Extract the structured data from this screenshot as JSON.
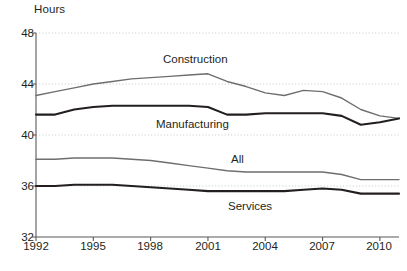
{
  "chart_data": {
    "type": "line",
    "title": "",
    "xlabel": "",
    "ylabel": "Hours",
    "ylim": [
      32,
      48
    ],
    "xlim": [
      1992,
      2011
    ],
    "yticks": [
      48,
      44,
      40,
      36,
      32
    ],
    "xticks": [
      1992,
      1995,
      1998,
      2001,
      2004,
      2007,
      2010
    ],
    "grid": "horizontal-dotted",
    "legend": "inline-annotations",
    "x": [
      1992,
      1993,
      1994,
      1995,
      1996,
      1997,
      1998,
      1999,
      2000,
      2001,
      2002,
      2003,
      2004,
      2005,
      2006,
      2007,
      2008,
      2009,
      2010,
      2011
    ],
    "series": [
      {
        "name": "Construction",
        "color": "#6d6e71",
        "width": 1.4,
        "values": [
          43.1,
          43.4,
          43.7,
          44.0,
          44.2,
          44.4,
          44.5,
          44.6,
          44.7,
          44.8,
          44.2,
          43.8,
          43.3,
          43.1,
          43.5,
          43.4,
          42.9,
          42.0,
          41.5,
          41.3
        ]
      },
      {
        "name": "Manufacturing",
        "color": "#231f20",
        "width": 2.1,
        "values": [
          41.6,
          41.6,
          42.0,
          42.2,
          42.3,
          42.3,
          42.3,
          42.3,
          42.3,
          42.2,
          41.6,
          41.6,
          41.7,
          41.7,
          41.7,
          41.7,
          41.5,
          40.8,
          41.0,
          41.3
        ]
      },
      {
        "name": "All",
        "color": "#6d6e71",
        "width": 1.4,
        "values": [
          38.1,
          38.1,
          38.2,
          38.2,
          38.2,
          38.1,
          38.0,
          37.8,
          37.6,
          37.4,
          37.2,
          37.1,
          37.1,
          37.1,
          37.1,
          37.1,
          36.9,
          36.5,
          36.5,
          36.5
        ]
      },
      {
        "name": "Services",
        "color": "#231f20",
        "width": 2.1,
        "values": [
          36.0,
          36.0,
          36.1,
          36.1,
          36.1,
          36.0,
          35.9,
          35.8,
          35.7,
          35.6,
          35.6,
          35.6,
          35.6,
          35.6,
          35.7,
          35.8,
          35.7,
          35.4,
          35.4,
          35.4
        ]
      }
    ],
    "annotations": [
      {
        "text": "Construction",
        "series": "Construction"
      },
      {
        "text": "Manufacturing",
        "series": "Manufacturing"
      },
      {
        "text": "All",
        "series": "All"
      },
      {
        "text": "Services",
        "series": "Services"
      }
    ]
  },
  "axes": {
    "y_unit_label": "Hours",
    "y_tick_labels": [
      "48",
      "44",
      "40",
      "36",
      "32"
    ],
    "x_tick_labels": [
      "1992",
      "1995",
      "1998",
      "2001",
      "2004",
      "2007",
      "2010"
    ]
  },
  "labels": {
    "construction": "Construction",
    "manufacturing": "Manufacturing",
    "all": "All",
    "services": "Services"
  },
  "colors": {
    "ink": "#231f20",
    "gray_line": "#6d6e71",
    "grid": "#bcbec0",
    "axis": "#58595b",
    "background": "#ffffff"
  }
}
